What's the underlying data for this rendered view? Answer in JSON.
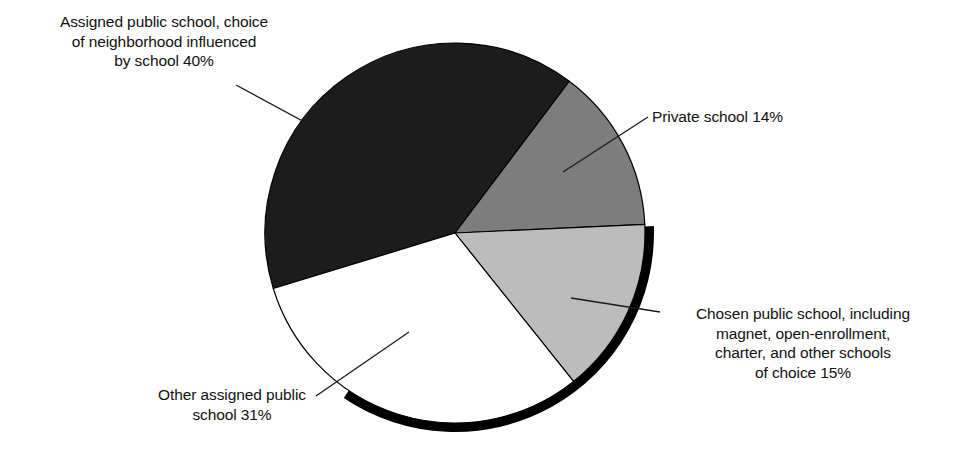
{
  "chart_data": {
    "type": "pie",
    "title": "",
    "subtitle": "",
    "xlabel": "",
    "ylabel": "",
    "legend_position": "none",
    "grid": false,
    "units": "percent",
    "total": 100,
    "start_angle_deg_clockwise_from_top": 37,
    "categories": [
      "Private school",
      "Chosen public school, including magnet, open-enrollment, charter, and other schools of choice",
      "Other assigned public school",
      "Assigned public school, choice of neighborhood influenced by school"
    ],
    "values": [
      14,
      15,
      31,
      40
    ],
    "slices": [
      {
        "name": "private-school",
        "label": "Private school 14%",
        "value": 14,
        "color": "#7d7d7d",
        "start_deg": 37,
        "sweep_deg": 50.4
      },
      {
        "name": "chosen-public-school",
        "label": "Chosen public school, including magnet, open-enrollment, charter, and other schools of choice 15%",
        "value": 15,
        "color": "#bcbcbc",
        "start_deg": 87.4,
        "sweep_deg": 54
      },
      {
        "name": "other-assigned-public-school",
        "label": "Other assigned public school 31%",
        "value": 31,
        "color": "#ffffff",
        "start_deg": 141.4,
        "sweep_deg": 111.6
      },
      {
        "name": "assigned-public-school-influenced",
        "label": "Assigned public school, choice of neighborhood influenced by school 40%",
        "value": 40,
        "color": "#1c1c1c",
        "start_deg": 253,
        "sweep_deg": 144
      }
    ],
    "annotations": [
      {
        "name": "assigned-influenced-callout",
        "text_lines": [
          "Assigned public school, choice",
          "of neighborhood influenced",
          "by school 40%"
        ],
        "text": "Assigned public school, choice\nof neighborhood influenced\nby school 40%"
      },
      {
        "name": "private-callout",
        "text_lines": [
          "Private school 14%"
        ],
        "text": "Private school 14%"
      },
      {
        "name": "chosen-public-callout",
        "text_lines": [
          "Chosen public school, including",
          "magnet, open-enrollment,",
          "charter, and other schools",
          "of choice 15%"
        ],
        "text": "Chosen public school, including\nmagnet, open-enrollment,\ncharter, and other schools\nof choice 15%"
      },
      {
        "name": "other-assigned-callout",
        "text_lines": [
          "Other assigned public",
          "school 31%"
        ],
        "text": "Other assigned public\nschool 31%"
      }
    ],
    "colors": {
      "slice_dark": "#1c1c1c",
      "slice_medium_gray": "#7d7d7d",
      "slice_light_gray": "#bcbcbc",
      "slice_white": "#ffffff",
      "outline": "#000000",
      "shadow": "#000000",
      "background": "#ffffff",
      "text": "#111111"
    }
  },
  "labels": {
    "assigned_influenced": "Assigned public school, choice\nof neighborhood influenced\nby school 40%",
    "private": "Private school 14%",
    "chosen_public": "Chosen public school, including\nmagnet, open-enrollment,\ncharter, and other schools\nof choice 15%",
    "other_assigned": "Other assigned public\nschool 31%"
  }
}
